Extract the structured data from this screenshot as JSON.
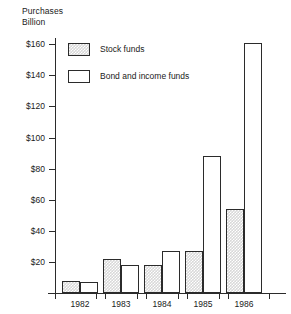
{
  "chart_data": {
    "type": "bar",
    "title": "",
    "title_lines": [
      "Purchases",
      "Billion"
    ],
    "xlabel": "",
    "ylabel": "Purchases Billion",
    "categories": [
      "1982",
      "1983",
      "1984",
      "1985",
      "1986"
    ],
    "series": [
      {
        "name": "Stock funds",
        "values": [
          8,
          22,
          18,
          27,
          54
        ],
        "fill": "hatched-gray",
        "color": "#d8d8d8"
      },
      {
        "name": "Bond and income funds",
        "values": [
          7,
          18,
          27,
          88,
          161
        ],
        "fill": "white",
        "color": "#ffffff"
      }
    ],
    "ylim": [
      0,
      164
    ],
    "yticks": [
      20,
      40,
      60,
      80,
      100,
      120,
      140,
      160
    ],
    "ytick_labels": [
      "$20",
      "$40",
      "$60",
      "$80",
      "$100",
      "$120",
      "$140",
      "$160"
    ],
    "grid": false,
    "legend_position": "upper-left-inside",
    "legend_entries": [
      "Stock funds",
      "Bond and income funds"
    ],
    "axis_color": "#2b2b2b",
    "background": "#ffffff"
  }
}
